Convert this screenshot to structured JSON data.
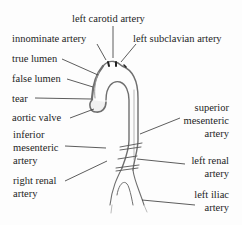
{
  "diagram": {
    "colors": {
      "ink": "#1e1e1e",
      "vessel_fill": "#f4f4f4",
      "vessel_shade": "#8a8a8a",
      "background": "#fdfdfd"
    },
    "labels": {
      "left_carotid": "left carotid artery",
      "innominate": "innominate artery",
      "left_subclavian": "left subclavian artery",
      "true_lumen": "true lumen",
      "false_lumen": "false lumen",
      "tear": "tear",
      "aortic_valve": "aortic valve",
      "inferior_mesenteric": [
        "inferior",
        "mesenteric",
        "artery"
      ],
      "right_renal": [
        "right renal",
        "artery"
      ],
      "superior_mesenteric": [
        "superior",
        "mesenteric",
        "artery"
      ],
      "left_renal": [
        "left renal",
        "artery"
      ],
      "left_iliac": [
        "left iliac",
        "artery"
      ]
    }
  }
}
